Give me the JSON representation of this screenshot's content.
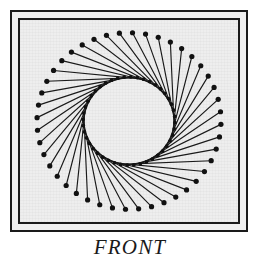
{
  "figure": {
    "caption": "FRONT",
    "plate_background": "#eeeeee",
    "page_background": "#ffffff",
    "ink_color": "#1a1a1a",
    "frame": {
      "style": "double-rule",
      "outer_rule_width_px": 2,
      "inner_rule_width_px": 2,
      "gap_px": 6
    }
  },
  "chart_data": {
    "type": "scatter",
    "title": "FRONT",
    "xlabel": "",
    "ylabel": "",
    "subtitle": "string-art envelope: outer ring of pins joined by straight threads to an offset inner ring",
    "grid": false,
    "legend": null,
    "center": {
      "x": 109,
      "y": 101
    },
    "outer_radius": 92,
    "inner_radius": 46,
    "point_count": 44,
    "step_offset": 9,
    "start_angle_deg": -96,
    "ellipse_ratio_x": 1.0,
    "ellipse_ratio_y": 0.96,
    "dot_radius_outer": 2.6,
    "dot_radius_inner": 1.9,
    "line_width": 1.15,
    "line_color": "#1a1a1a",
    "dot_color": "#111111",
    "annotations": [
      "FRONT"
    ]
  }
}
